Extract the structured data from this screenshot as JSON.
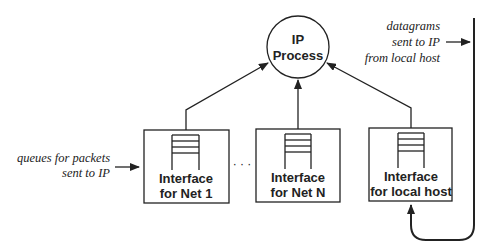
{
  "diagram": {
    "process": {
      "line1": "IP",
      "line2": "Process"
    },
    "interfaces": [
      {
        "line1": "Interface",
        "line2": "for Net 1"
      },
      {
        "line1": "Interface",
        "line2": "for Net N"
      },
      {
        "line1": "Interface",
        "line2": "for local host"
      }
    ],
    "ellipsis": "· · ·",
    "annotations": {
      "queues": {
        "line1": "queues for packets",
        "line2": "sent to IP"
      },
      "local": {
        "line1": "datagrams",
        "line2": "sent to IP",
        "line3": "from local host"
      }
    },
    "colors": {
      "stroke": "#222222",
      "background": "#ffffff"
    }
  }
}
